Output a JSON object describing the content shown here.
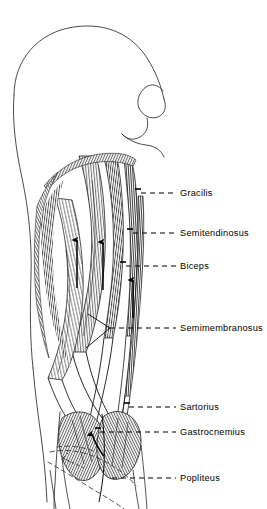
{
  "figure": {
    "background_color": "#ffffff",
    "ink_color": "#000000",
    "width": 267,
    "height": 509
  },
  "labels": [
    {
      "id": "gracilis",
      "text": "Gracilis",
      "x": 180,
      "y": 189,
      "leader_y": 193,
      "leader_x1": 141,
      "leader_x2": 176
    },
    {
      "id": "semitendinosus",
      "text": "Semitendinosus",
      "x": 180,
      "y": 229,
      "leader_y": 233,
      "leader_x1": 133,
      "leader_x2": 176
    },
    {
      "id": "biceps",
      "text": "Biceps",
      "x": 180,
      "y": 262,
      "leader_y": 266,
      "leader_x1": 126,
      "leader_x2": 176
    },
    {
      "id": "semimembranosus",
      "text": "Semimembranosus",
      "x": 180,
      "y": 324,
      "leader_y": 328,
      "leader_x1": 102,
      "leader_x2": 176
    },
    {
      "id": "sartorius",
      "text": "Sartorius",
      "x": 180,
      "y": 403,
      "leader_y": 407,
      "leader_x1": 129,
      "leader_x2": 176
    },
    {
      "id": "gastrocnemius",
      "text": "Gastrocnemius",
      "x": 180,
      "y": 428,
      "leader_y": 432,
      "leader_x1": 100,
      "leader_x2": 176
    },
    {
      "id": "popliteus",
      "text": "Popliteus",
      "x": 180,
      "y": 474,
      "leader_y": 478,
      "leader_x1": 112,
      "leader_x2": 176
    }
  ],
  "annotations": {
    "direction_arrows": [
      {
        "id": "arrow-semitendinosus-pull",
        "x": 77,
        "y_tip": 238,
        "y_tail": 288,
        "style": "straight-up"
      },
      {
        "id": "arrow-biceps-pull",
        "x": 103,
        "y_tip": 240,
        "y_tail": 290,
        "style": "straight-up"
      },
      {
        "id": "arrow-biceps-distal-pull",
        "x": 133,
        "y_tip": 278,
        "y_tail": 318,
        "style": "straight-up"
      },
      {
        "id": "arrow-gastrocnemius-head",
        "x": 92,
        "y_tip": 430,
        "y_tail": 455,
        "style": "curved-up-left"
      }
    ],
    "dashed_deep_outline": "popliteus-deep-outline",
    "forked_leader": "semimembranosus-two-point-leader"
  }
}
